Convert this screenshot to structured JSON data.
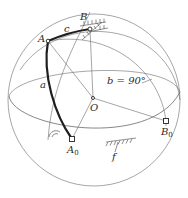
{
  "diagram": {
    "type": "spherical four-bar linkage",
    "points": {
      "A": {
        "label": "A",
        "x": 48,
        "y": 41
      },
      "B": {
        "label": "B",
        "x": 90,
        "y": 29
      },
      "O": {
        "label": "O",
        "x": 93,
        "y": 98
      },
      "A0": {
        "label": "A",
        "sub": "0",
        "x": 72,
        "y": 139
      },
      "B0": {
        "label": "B",
        "sub": "0",
        "x": 166,
        "y": 121
      }
    },
    "links": {
      "a": {
        "label": "a"
      },
      "c": {
        "label": "c"
      },
      "b": {
        "label": "b = 90°"
      },
      "f": {
        "label": "f"
      }
    },
    "colors": {
      "line": "#6a6a6a",
      "link": "#1e1e1e",
      "background": "#ffffff"
    }
  }
}
